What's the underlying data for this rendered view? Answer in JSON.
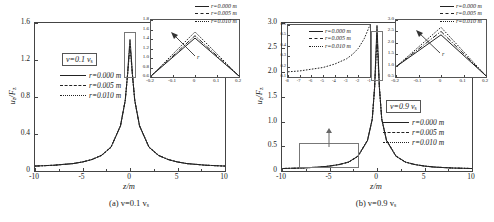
{
  "figure": {
    "panels": [
      {
        "id": "a",
        "caption": "(a) v=0.1 v",
        "caption_sub": "s",
        "xlabel": "z/m",
        "ylabel_main": "u",
        "ylabel_sub1": "z",
        "ylabel_mid": "/F",
        "ylabel_sub2": "z",
        "velocity_box": "v=0.1 v",
        "velocity_box_sub": "s",
        "xticks": [
          "-10",
          "-5",
          "0",
          "5",
          "10"
        ],
        "yticks": [
          "0",
          "0.4",
          "0.8",
          "1.2",
          "1.6"
        ],
        "legend": [
          {
            "label": "r=0.000 m",
            "style": "solid"
          },
          {
            "label": "r=0.005 m",
            "style": "dashdot"
          },
          {
            "label": "r=0.010 m",
            "style": "dot"
          }
        ],
        "inset": {
          "xticks": [
            "-0.2",
            "-0.1",
            "0",
            "0.1",
            "0.2"
          ],
          "yticks": [
            "0.6",
            "0.8",
            "1.0",
            "1.2",
            "1.4",
            "1.6",
            "1.8"
          ],
          "annotation": "r",
          "legend": [
            {
              "label": "r=0.000 m",
              "style": "solid"
            },
            {
              "label": "r=0.005 m",
              "style": "dashdot"
            },
            {
              "label": "r=0.010 m",
              "style": "dot"
            }
          ]
        }
      },
      {
        "id": "b",
        "caption": "(b) v=0.9 v",
        "caption_sub": "s",
        "xlabel": "z/m",
        "ylabel_main": "u",
        "ylabel_sub1": "z",
        "ylabel_mid": "/F",
        "ylabel_sub2": "z",
        "velocity_box": "v=0.9 v",
        "velocity_box_sub": "s",
        "xticks": [
          "-10",
          "-5",
          "0",
          "5",
          "10"
        ],
        "yticks": [
          "0",
          "0.5",
          "1.0",
          "1.5",
          "2.0",
          "2.5",
          "3.0"
        ],
        "legend": [
          {
            "label": "r=0.000 m",
            "style": "solid"
          },
          {
            "label": "r=0.005 m",
            "style": "dashdot"
          },
          {
            "label": "r=0.010 m",
            "style": "dot"
          }
        ],
        "inset_left": {
          "xticks": [
            "-8",
            "-7",
            "-6",
            "-5",
            "-4",
            "-3",
            "-2",
            "-1"
          ],
          "yticks": [
            "0.1",
            "0.2",
            "0.3",
            "0.4",
            "0.5",
            "0.6"
          ],
          "legend": [
            {
              "label": "r=0.000 m",
              "style": "solid"
            },
            {
              "label": "r=0.005 m",
              "style": "dashdot"
            },
            {
              "label": "r=0.010 m",
              "style": "dot"
            }
          ]
        },
        "inset_right": {
          "xticks": [
            "-0.2",
            "-0.1",
            "0",
            "0.1",
            "0.2"
          ],
          "yticks": [
            "0.5",
            "1.0",
            "1.5",
            "2.0",
            "2.5",
            "3.0"
          ],
          "annotation": "r",
          "legend": [
            {
              "label": "r=0.000 m",
              "style": "solid"
            },
            {
              "label": "r=0.005 m",
              "style": "dashdot"
            },
            {
              "label": "r=0.010 m",
              "style": "dot"
            }
          ]
        }
      }
    ]
  },
  "chart_data": [
    {
      "type": "line",
      "title": "(a) v=0.1 v_s",
      "xlabel": "z/m",
      "ylabel": "u_z/F_z",
      "xlim": [
        -10,
        10
      ],
      "ylim": [
        0,
        1.8
      ],
      "grid": false,
      "legend_position": "upper-left-inside",
      "series": [
        {
          "name": "r=0.000 m",
          "style": "solid",
          "x": [
            -10,
            -9,
            -8,
            -7,
            -6,
            -5,
            -4,
            -3,
            -2,
            -1,
            -0.5,
            -0.25,
            -0.1,
            0,
            0.1,
            0.25,
            0.5,
            1,
            2,
            3,
            4,
            5,
            6,
            7,
            8,
            9,
            10
          ],
          "y": [
            0.06,
            0.065,
            0.07,
            0.08,
            0.09,
            0.11,
            0.14,
            0.19,
            0.29,
            0.55,
            0.86,
            1.18,
            1.45,
            1.6,
            1.45,
            1.18,
            0.86,
            0.55,
            0.29,
            0.19,
            0.14,
            0.11,
            0.09,
            0.08,
            0.07,
            0.065,
            0.06
          ]
        },
        {
          "name": "r=0.005 m",
          "style": "dashdot",
          "x": [
            -10,
            -9,
            -8,
            -7,
            -6,
            -5,
            -4,
            -3,
            -2,
            -1,
            -0.5,
            -0.25,
            -0.1,
            0,
            0.1,
            0.25,
            0.5,
            1,
            2,
            3,
            4,
            5,
            6,
            7,
            8,
            9,
            10
          ],
          "y": [
            0.06,
            0.065,
            0.07,
            0.08,
            0.09,
            0.11,
            0.14,
            0.19,
            0.29,
            0.55,
            0.86,
            1.18,
            1.42,
            1.52,
            1.42,
            1.18,
            0.86,
            0.55,
            0.29,
            0.19,
            0.14,
            0.11,
            0.09,
            0.08,
            0.07,
            0.065,
            0.06
          ]
        },
        {
          "name": "r=0.010 m",
          "style": "dot",
          "x": [
            -10,
            -9,
            -8,
            -7,
            -6,
            -5,
            -4,
            -3,
            -2,
            -1,
            -0.5,
            -0.25,
            -0.1,
            0,
            0.1,
            0.25,
            0.5,
            1,
            2,
            3,
            4,
            5,
            6,
            7,
            8,
            9,
            10
          ],
          "y": [
            0.06,
            0.065,
            0.07,
            0.08,
            0.09,
            0.11,
            0.14,
            0.19,
            0.29,
            0.55,
            0.86,
            1.18,
            1.38,
            1.46,
            1.38,
            1.18,
            0.86,
            0.55,
            0.29,
            0.19,
            0.14,
            0.11,
            0.09,
            0.08,
            0.07,
            0.065,
            0.06
          ]
        }
      ],
      "inset": {
        "xlim": [
          -0.2,
          0.2
        ],
        "ylim": [
          0.6,
          1.8
        ],
        "annotation": "r",
        "series": [
          {
            "name": "r=0.000 m",
            "style": "solid",
            "x": [
              -0.2,
              0,
              0.2
            ],
            "y": [
              0.62,
              1.42,
              0.62
            ]
          },
          {
            "name": "r=0.005 m",
            "style": "dashdot",
            "x": [
              -0.2,
              0,
              0.2
            ],
            "y": [
              0.62,
              1.47,
              0.62
            ]
          },
          {
            "name": "r=0.010 m",
            "style": "dot",
            "x": [
              -0.2,
              0,
              0.2
            ],
            "y": [
              0.62,
              1.55,
              0.62
            ]
          }
        ]
      }
    },
    {
      "type": "line",
      "title": "(b) v=0.9 v_s",
      "xlabel": "z/m",
      "ylabel": "u_z/F_z",
      "xlim": [
        -10,
        10
      ],
      "ylim": [
        0,
        3.0
      ],
      "grid": false,
      "legend_position": "right-inside",
      "series": [
        {
          "name": "r=0.000 m",
          "style": "solid",
          "x": [
            -10,
            -9,
            -8,
            -7,
            -6,
            -5,
            -4,
            -3,
            -2,
            -1,
            -0.5,
            -0.25,
            -0.1,
            0,
            0.1,
            0.25,
            0.5,
            1,
            2,
            3,
            4,
            5,
            6,
            7,
            8,
            9,
            10
          ],
          "y": [
            0.05,
            0.055,
            0.06,
            0.07,
            0.08,
            0.1,
            0.13,
            0.18,
            0.3,
            0.62,
            1.05,
            1.7,
            2.45,
            2.95,
            2.45,
            1.7,
            1.05,
            0.62,
            0.3,
            0.18,
            0.13,
            0.1,
            0.08,
            0.07,
            0.06,
            0.055,
            0.05
          ]
        },
        {
          "name": "r=0.005 m",
          "style": "dashdot",
          "x": [
            -10,
            -9,
            -8,
            -7,
            -6,
            -5,
            -4,
            -3,
            -2,
            -1,
            -0.5,
            -0.25,
            -0.1,
            0,
            0.1,
            0.25,
            0.5,
            1,
            2,
            3,
            4,
            5,
            6,
            7,
            8,
            9,
            10
          ],
          "y": [
            0.05,
            0.055,
            0.06,
            0.07,
            0.08,
            0.1,
            0.13,
            0.18,
            0.3,
            0.62,
            1.05,
            1.7,
            2.4,
            2.8,
            2.4,
            1.7,
            1.05,
            0.62,
            0.3,
            0.18,
            0.13,
            0.1,
            0.08,
            0.07,
            0.06,
            0.055,
            0.05
          ]
        },
        {
          "name": "r=0.010 m",
          "style": "dot",
          "x": [
            -10,
            -9,
            -8,
            -7,
            -6,
            -5,
            -4,
            -3,
            -2,
            -1,
            -0.5,
            -0.25,
            -0.1,
            0,
            0.1,
            0.25,
            0.5,
            1,
            2,
            3,
            4,
            5,
            6,
            7,
            8,
            9,
            10
          ],
          "y": [
            0.05,
            0.055,
            0.06,
            0.07,
            0.08,
            0.1,
            0.13,
            0.18,
            0.3,
            0.62,
            1.05,
            1.7,
            2.3,
            2.62,
            2.3,
            1.7,
            1.05,
            0.62,
            0.3,
            0.18,
            0.13,
            0.1,
            0.08,
            0.07,
            0.06,
            0.055,
            0.05
          ]
        }
      ],
      "inset_left": {
        "xlim": [
          -8,
          -1
        ],
        "ylim": [
          0.0,
          0.6
        ],
        "series": [
          {
            "name": "r=0.010 m",
            "style": "dot",
            "x": [
              -8,
              -7.5,
              -7,
              -6.5,
              -6,
              -5.5,
              -5,
              -4.5,
              -4,
              -3.5,
              -3,
              -2.5,
              -2,
              -1.5,
              -1
            ],
            "y": [
              0.06,
              0.065,
              0.07,
              0.08,
              0.09,
              0.1,
              0.11,
              0.13,
              0.15,
              0.18,
              0.21,
              0.26,
              0.33,
              0.44,
              0.6
            ]
          }
        ]
      },
      "inset_right": {
        "xlim": [
          -0.2,
          0.2
        ],
        "ylim": [
          0.5,
          3.0
        ],
        "annotation": "r",
        "series": [
          {
            "name": "r=0.000 m",
            "style": "solid",
            "x": [
              -0.2,
              0,
              0.2
            ],
            "y": [
              0.95,
              2.35,
              0.55
            ]
          },
          {
            "name": "r=0.005 m",
            "style": "dashdot",
            "x": [
              -0.2,
              0,
              0.2
            ],
            "y": [
              0.95,
              2.5,
              0.55
            ]
          },
          {
            "name": "r=0.010 m",
            "style": "dot",
            "x": [
              -0.2,
              0,
              0.2
            ],
            "y": [
              0.95,
              2.68,
              0.55
            ]
          }
        ]
      }
    }
  ]
}
